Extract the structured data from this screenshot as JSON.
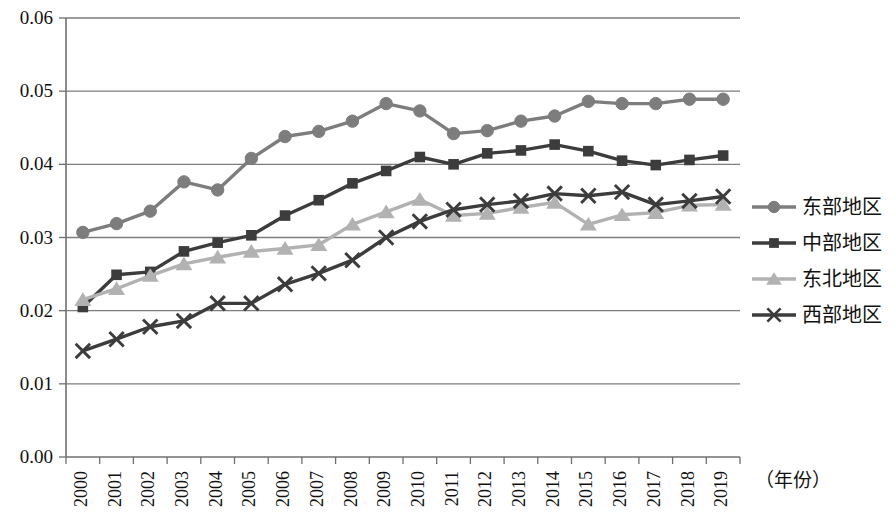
{
  "chart_data": {
    "type": "line",
    "title": "",
    "xlabel": "（年份）",
    "ylabel": "",
    "grid": true,
    "legend_position": "right",
    "ylim": [
      0.0,
      0.06
    ],
    "ytick_labels": [
      "0.00",
      "0.01",
      "0.02",
      "0.03",
      "0.04",
      "0.05",
      "0.06"
    ],
    "ytick_values": [
      0.0,
      0.01,
      0.02,
      0.03,
      0.04,
      0.05,
      0.06
    ],
    "categories": [
      "2000",
      "2001",
      "2002",
      "2003",
      "2004",
      "2005",
      "2006",
      "2007",
      "2008",
      "2009",
      "2010",
      "2011",
      "2012",
      "2013",
      "2014",
      "2015",
      "2016",
      "2017",
      "2018",
      "2019"
    ],
    "series": [
      {
        "name": "东部地区",
        "marker": "circle",
        "color": "#7d7d7d",
        "values": [
          0.0307,
          0.0319,
          0.0336,
          0.0376,
          0.0365,
          0.0408,
          0.0438,
          0.0445,
          0.0459,
          0.0483,
          0.0473,
          0.0442,
          0.0446,
          0.0459,
          0.0466,
          0.0486,
          0.0483,
          0.0483,
          0.0489,
          0.0489
        ]
      },
      {
        "name": "中部地区",
        "marker": "square",
        "color": "#3c3c3c",
        "values": [
          0.0205,
          0.0249,
          0.0253,
          0.0281,
          0.0293,
          0.0303,
          0.033,
          0.0351,
          0.0374,
          0.0391,
          0.041,
          0.04,
          0.0415,
          0.0419,
          0.0427,
          0.0418,
          0.0405,
          0.0399,
          0.0406,
          0.0412
        ]
      },
      {
        "name": "东北地区",
        "marker": "triangle",
        "color": "#b2b2b2",
        "values": [
          0.0215,
          0.023,
          0.0248,
          0.0264,
          0.0273,
          0.0281,
          0.0285,
          0.029,
          0.0318,
          0.0335,
          0.0352,
          0.033,
          0.0333,
          0.0341,
          0.0348,
          0.0318,
          0.0331,
          0.0334,
          0.0344,
          0.0345
        ]
      },
      {
        "name": "西部地区",
        "marker": "x",
        "color": "#3c3c3c",
        "values": [
          0.0145,
          0.0161,
          0.0178,
          0.0186,
          0.021,
          0.021,
          0.0236,
          0.0251,
          0.0269,
          0.03,
          0.0322,
          0.0338,
          0.0345,
          0.035,
          0.036,
          0.0357,
          0.0362,
          0.0345,
          0.035,
          0.0356
        ]
      }
    ]
  },
  "legend": {
    "items": [
      {
        "label": "东部地区"
      },
      {
        "label": "中部地区"
      },
      {
        "label": "东北地区"
      },
      {
        "label": "西部地区"
      }
    ]
  },
  "axis_caption": "（年份）"
}
